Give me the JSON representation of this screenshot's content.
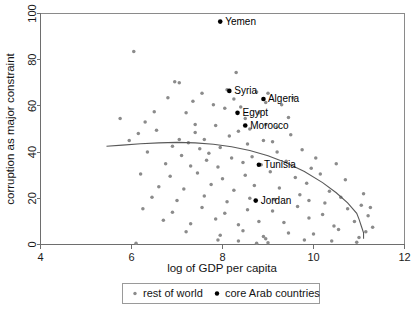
{
  "chart_data": {
    "type": "scatter",
    "title": "",
    "xlabel": "log of GDP per capita",
    "ylabel": "corruption as major constraint",
    "xlim": [
      4,
      12
    ],
    "ylim": [
      0,
      100
    ],
    "xticks": [
      4,
      6,
      8,
      10,
      12
    ],
    "yticks": [
      0,
      20,
      40,
      60,
      80,
      100
    ],
    "xtick_labels": [
      "4",
      "6",
      "8",
      "10",
      "12"
    ],
    "ytick_labels": [
      "0",
      "20",
      "40",
      "60",
      "80",
      "100"
    ],
    "grid": false,
    "legend_position": "below-axes",
    "legend": [
      {
        "name": "rest of world",
        "color": "#8b8b8b",
        "marker": "small-dot"
      },
      {
        "name": "core Arab countries",
        "color": "#000000",
        "marker": "dot"
      }
    ],
    "series": [
      {
        "name": "rest of world",
        "color": "#8b8b8b",
        "points": [
          [
            6.05,
            83.5
          ],
          [
            5.75,
            54.5
          ],
          [
            6.5,
            57.5
          ],
          [
            6.95,
            70.5
          ],
          [
            7.05,
            70.0
          ],
          [
            7.55,
            65.5
          ],
          [
            8.3,
            74.5
          ],
          [
            8.1,
            67.0
          ],
          [
            8.75,
            66.0
          ],
          [
            9.0,
            65.5
          ],
          [
            7.35,
            62.0
          ],
          [
            8.4,
            59.5
          ],
          [
            8.05,
            59.0
          ],
          [
            9.55,
            63.5
          ],
          [
            7.2,
            57.0
          ],
          [
            8.95,
            61.5
          ],
          [
            9.3,
            60.5
          ],
          [
            6.55,
            49.5
          ],
          [
            7.4,
            52.0
          ],
          [
            7.85,
            51.5
          ],
          [
            8.35,
            49.0
          ],
          [
            8.6,
            50.0
          ],
          [
            8.95,
            52.0
          ],
          [
            7.05,
            45.5
          ],
          [
            7.25,
            44.0
          ],
          [
            7.6,
            45.5
          ],
          [
            8.15,
            47.0
          ],
          [
            6.9,
            42.5
          ],
          [
            7.5,
            41.5
          ],
          [
            7.95,
            42.0
          ],
          [
            8.55,
            43.5
          ],
          [
            9.1,
            44.5
          ],
          [
            6.35,
            40.0
          ],
          [
            7.1,
            38.5
          ],
          [
            7.7,
            39.5
          ],
          [
            8.2,
            37.5
          ],
          [
            8.65,
            38.0
          ],
          [
            9.2,
            40.0
          ],
          [
            9.75,
            41.0
          ],
          [
            6.75,
            35.0
          ],
          [
            7.3,
            34.0
          ],
          [
            7.9,
            33.5
          ],
          [
            8.45,
            35.5
          ],
          [
            8.85,
            34.5
          ],
          [
            9.4,
            36.0
          ],
          [
            9.95,
            33.0
          ],
          [
            6.2,
            30.5
          ],
          [
            6.85,
            29.5
          ],
          [
            7.45,
            31.0
          ],
          [
            8.0,
            28.5
          ],
          [
            8.5,
            30.0
          ],
          [
            9.05,
            31.5
          ],
          [
            9.6,
            29.0
          ],
          [
            10.15,
            30.5
          ],
          [
            6.6,
            25.0
          ],
          [
            7.15,
            24.0
          ],
          [
            7.75,
            26.0
          ],
          [
            8.25,
            23.5
          ],
          [
            8.7,
            25.5
          ],
          [
            9.25,
            24.5
          ],
          [
            9.85,
            26.5
          ],
          [
            10.35,
            23.0
          ],
          [
            6.45,
            20.5
          ],
          [
            7.0,
            19.0
          ],
          [
            7.6,
            21.0
          ],
          [
            8.1,
            18.5
          ],
          [
            8.6,
            20.0
          ],
          [
            9.15,
            19.5
          ],
          [
            9.7,
            21.5
          ],
          [
            10.25,
            18.0
          ],
          [
            10.6,
            20.5
          ],
          [
            6.25,
            15.5
          ],
          [
            6.9,
            14.0
          ],
          [
            7.55,
            16.0
          ],
          [
            8.05,
            13.5
          ],
          [
            8.55,
            15.0
          ],
          [
            9.1,
            14.5
          ],
          [
            9.65,
            16.5
          ],
          [
            10.2,
            13.0
          ],
          [
            10.75,
            15.5
          ],
          [
            11.05,
            17.0
          ],
          [
            6.7,
            10.5
          ],
          [
            7.3,
            9.0
          ],
          [
            7.85,
            11.0
          ],
          [
            8.35,
            8.5
          ],
          [
            8.8,
            10.0
          ],
          [
            9.35,
            9.5
          ],
          [
            9.9,
            11.5
          ],
          [
            10.45,
            8.0
          ],
          [
            10.9,
            10.0
          ],
          [
            11.2,
            12.5
          ],
          [
            7.2,
            5.5
          ],
          [
            7.95,
            4.0
          ],
          [
            8.45,
            6.0
          ],
          [
            8.9,
            3.5
          ],
          [
            9.45,
            5.0
          ],
          [
            10.0,
            4.5
          ],
          [
            10.55,
            6.5
          ],
          [
            11.0,
            3.0
          ],
          [
            11.3,
            7.5
          ],
          [
            6.1,
            0.5
          ],
          [
            7.9,
            2.0
          ],
          [
            8.35,
            1.5
          ],
          [
            8.75,
            0.5
          ],
          [
            8.95,
            2.5
          ],
          [
            9.0,
            0.8
          ],
          [
            9.8,
            2.0
          ],
          [
            10.4,
            1.5
          ],
          [
            10.95,
            1.0
          ],
          [
            11.15,
            5.5
          ],
          [
            5.95,
            45.0
          ],
          [
            6.15,
            48.0
          ],
          [
            7.65,
            36.5
          ],
          [
            8.9,
            45.0
          ],
          [
            9.5,
            47.5
          ],
          [
            10.05,
            37.5
          ],
          [
            10.7,
            28.0
          ],
          [
            11.1,
            22.0
          ],
          [
            6.3,
            53.0
          ],
          [
            8.8,
            57.0
          ],
          [
            9.45,
            55.0
          ],
          [
            7.8,
            60.5
          ],
          [
            8.25,
            63.0
          ],
          [
            6.8,
            63.5
          ],
          [
            9.9,
            19.0
          ],
          [
            10.5,
            35.0
          ],
          [
            11.25,
            16.0
          ],
          [
            7.4,
            48.5
          ],
          [
            8.5,
            54.5
          ],
          [
            9.2,
            51.0
          ]
        ]
      },
      {
        "name": "core Arab countries",
        "color": "#000000",
        "points": [
          {
            "label": "Yemen",
            "x": 7.95,
            "y": 96.5,
            "label_dx": 5,
            "label_dy": 3.5
          },
          {
            "label": "Syria",
            "x": 8.15,
            "y": 66.5,
            "label_dx": 5,
            "label_dy": 3.5
          },
          {
            "label": "Algeria",
            "x": 8.9,
            "y": 63.0,
            "label_dx": 4.5,
            "label_dy": 3.5
          },
          {
            "label": "Egypt",
            "x": 8.33,
            "y": 57.0,
            "label_dx": 5,
            "label_dy": 3.5
          },
          {
            "label": "Morocco",
            "x": 8.5,
            "y": 51.5,
            "label_dx": 5,
            "label_dy": 3.5
          },
          {
            "label": "Tunisia",
            "x": 8.8,
            "y": 34.5,
            "label_dx": 5,
            "label_dy": 3.5
          },
          {
            "label": "Jordan",
            "x": 8.73,
            "y": 19.0,
            "label_dx": 5,
            "label_dy": 3.5
          }
        ]
      }
    ],
    "fit_curve": {
      "name": "quadratic fit",
      "color": "#595959",
      "points": [
        [
          5.45,
          42.5
        ],
        [
          5.8,
          43.0
        ],
        [
          6.2,
          43.6
        ],
        [
          6.6,
          44.0
        ],
        [
          7.0,
          44.2
        ],
        [
          7.4,
          44.0
        ],
        [
          7.8,
          43.4
        ],
        [
          8.2,
          42.3
        ],
        [
          8.6,
          40.7
        ],
        [
          9.0,
          38.4
        ],
        [
          9.4,
          35.4
        ],
        [
          9.8,
          31.6
        ],
        [
          10.2,
          26.8
        ],
        [
          10.5,
          22.4
        ],
        [
          10.75,
          18.0
        ],
        [
          10.95,
          13.5
        ],
        [
          11.0,
          11.0
        ],
        [
          11.05,
          8.0
        ],
        [
          11.1,
          5.0
        ],
        [
          11.1,
          2.5
        ]
      ]
    }
  }
}
